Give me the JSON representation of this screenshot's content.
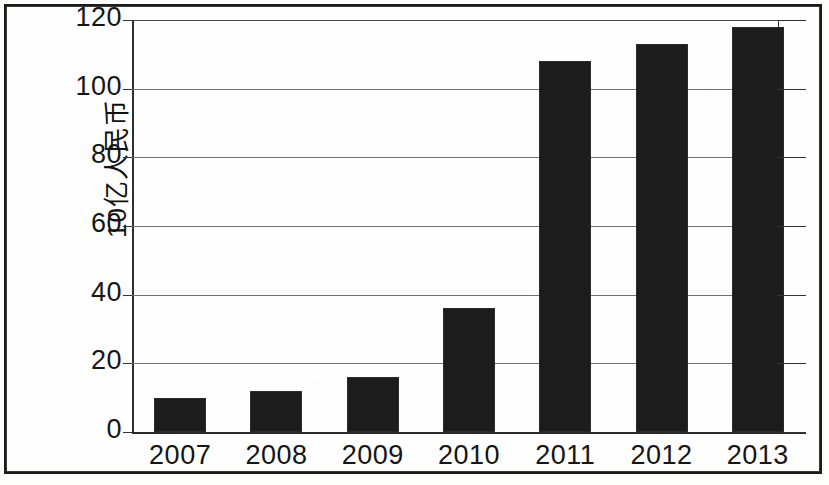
{
  "chart_data": {
    "type": "bar",
    "title": "",
    "subtitle": "",
    "xlabel": "",
    "ylabel": "10亿人民币",
    "categories": [
      "2007",
      "2008",
      "2009",
      "2010",
      "2011",
      "2012",
      "2013"
    ],
    "values": [
      10,
      12,
      16,
      36,
      108,
      113,
      118
    ],
    "series": [
      {
        "name": "",
        "values": [
          10,
          12,
          16,
          36,
          108,
          113,
          118
        ]
      }
    ],
    "ylim": [
      0,
      120
    ],
    "y_ticks": [
      0,
      20,
      40,
      60,
      80,
      100,
      120
    ],
    "y_tick_labels": [
      "0",
      "20",
      "40",
      "60",
      "80",
      "100",
      "120"
    ],
    "grid": true,
    "grid_axis": "y",
    "legend": false,
    "legend_position": "none",
    "bar_color": "#1c1c1c",
    "gridline_color": "#6f6f6f",
    "axis_color": "#2f2f2f",
    "background": "#fefefe",
    "frame_color": "#1b1b1b"
  }
}
